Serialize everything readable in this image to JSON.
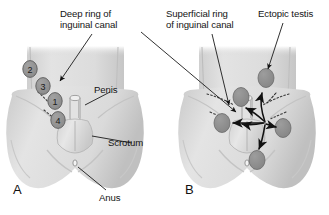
{
  "figure": {
    "type": "anatomical-illustration",
    "background_color": "#ffffff",
    "body_fill": "#d8d8d8",
    "body_fill_light": "#e6e6e6",
    "body_shadow": "#c2c2c2",
    "testis_fill": "#8e8e8e",
    "outline_color": "#6e6e6e",
    "line_color": "#1a1a1a",
    "text_color": "#141414"
  },
  "labels": {
    "deep_ring": "Deep ring of\ninguinal canal",
    "superficial_ring": "Superficial ring\nof inguinal canal",
    "ectopic_testis": "Ectopic testis",
    "penis": "Penis",
    "scrotum": "Scrotum",
    "anus": "Anus"
  },
  "panels": [
    {
      "letter": "A",
      "name": "panel-a",
      "description": "Numbered sites of undescended testis along the normal descent path",
      "markers": [
        {
          "number": "1",
          "cx": 55,
          "cy": 101,
          "rx": 7.2,
          "ry": 8.4
        },
        {
          "number": "2",
          "cx": 30,
          "cy": 69,
          "rx": 7.2,
          "ry": 8.4
        },
        {
          "number": "3",
          "cx": 43,
          "cy": 86,
          "rx": 7.2,
          "ry": 8.4
        },
        {
          "number": "4",
          "cx": 58,
          "cy": 120,
          "rx": 7.2,
          "ry": 8.4
        }
      ]
    },
    {
      "letter": "B",
      "name": "panel-b",
      "description": "Ectopic testis sites with arrows of aberrant migration",
      "ectopic_testes": [
        {
          "name": "suprapubic",
          "cx": 241,
          "cy": 97,
          "rx": 8,
          "ry": 9.5
        },
        {
          "name": "femoral",
          "cx": 222,
          "cy": 123,
          "rx": 8,
          "ry": 9.5
        },
        {
          "name": "perineal",
          "cx": 257,
          "cy": 160,
          "rx": 8,
          "ry": 9.5
        },
        {
          "name": "contralateral",
          "cx": 283,
          "cy": 128,
          "rx": 8,
          "ry": 9.5
        },
        {
          "name": "abdominal-wall",
          "cx": 266,
          "cy": 78,
          "rx": 8,
          "ry": 9.5
        }
      ]
    }
  ]
}
